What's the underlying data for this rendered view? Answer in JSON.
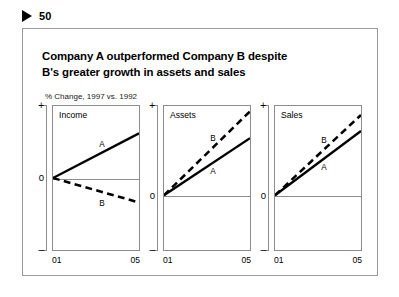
{
  "header": {
    "marker_icon": "triangle-right-icon",
    "page_number": "50"
  },
  "slide": {
    "title_line1": "Company A outperformed Company B despite",
    "title_line2": "B's greater growth in assets and sales",
    "subtitle": "% Change, 1997 vs. 1992"
  },
  "chart_data": [
    {
      "type": "line",
      "title": "Income",
      "xlabel": "",
      "ylabel": "% Change",
      "x": [
        "01",
        "05"
      ],
      "axis_labels": {
        "plus": "+",
        "zero": "0",
        "minus": "–"
      },
      "zero_fraction": 0.5,
      "ylim": [
        -1,
        1
      ],
      "grid": false,
      "legend": "inline",
      "series": [
        {
          "name": "A",
          "values": [
            0,
            0.62
          ],
          "style": "solid",
          "label": "A"
        },
        {
          "name": "B",
          "values": [
            0,
            -0.34
          ],
          "style": "dashed",
          "label": "B"
        }
      ]
    },
    {
      "type": "line",
      "title": "Assets",
      "xlabel": "",
      "ylabel": "% Change",
      "x": [
        "01",
        "05"
      ],
      "axis_labels": {
        "plus": "+",
        "zero": "0",
        "minus": "–"
      },
      "zero_fraction": 0.62,
      "ylim": [
        -1,
        1
      ],
      "grid": false,
      "legend": "inline",
      "series": [
        {
          "name": "A",
          "values": [
            0,
            0.64
          ],
          "style": "solid",
          "label": "A"
        },
        {
          "name": "B",
          "values": [
            0,
            0.94
          ],
          "style": "dashed",
          "label": "B"
        }
      ]
    },
    {
      "type": "line",
      "title": "Sales",
      "xlabel": "",
      "ylabel": "% Change",
      "x": [
        "01",
        "05"
      ],
      "axis_labels": {
        "plus": "+",
        "zero": "0",
        "minus": "–"
      },
      "zero_fraction": 0.62,
      "ylim": [
        -1,
        1
      ],
      "grid": false,
      "legend": "inline",
      "series": [
        {
          "name": "A",
          "values": [
            0,
            0.72
          ],
          "style": "solid",
          "label": "A"
        },
        {
          "name": "B",
          "values": [
            0,
            0.9
          ],
          "style": "dashed",
          "label": "B"
        }
      ]
    }
  ],
  "colors": {
    "series": "#000000",
    "axis": "#8d8d8d",
    "frame": "#9a9a9a",
    "background": "#ffffff"
  }
}
